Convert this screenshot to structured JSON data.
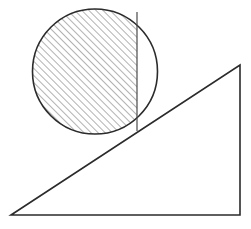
{
  "canvas": {
    "width": 251,
    "height": 229,
    "background_color": "#ffffff",
    "title": "Circle resting on an inclined plane with shaded circular segment"
  },
  "style": {
    "stroke_color": "#2b2b2b",
    "stroke_color_light": "#4a4a4a",
    "hatch_color": "#555555",
    "outline_width": 1.6,
    "chord_width": 1.2,
    "hatch_width": 0.9,
    "hatch_spacing": 5,
    "hatch_angle_degrees": 45,
    "fill_color": "none"
  },
  "figure": {
    "circle": {
      "label": "circle",
      "center_x": 95,
      "center_y": 71.5,
      "radius": 62.5
    },
    "chord": {
      "label": "vertical chord",
      "x": 137,
      "y_top": 12,
      "y_bottom": 131
    },
    "shaded_segment": {
      "label": "hatched major segment left of chord",
      "hatched": true
    },
    "unshaded_segment": {
      "label": "clear minor segment right of chord",
      "hatched": false
    },
    "triangle": {
      "label": "right triangle inclined plane",
      "points": "11,215 240,65 240,215",
      "vertex_left": {
        "x": 11,
        "y": 215
      },
      "vertex_apex": {
        "x": 240,
        "y": 65
      },
      "vertex_right": {
        "x": 240,
        "y": 215
      }
    },
    "tangent_point": {
      "label": "contact point of circle and incline",
      "x": 137,
      "y": 131
    }
  }
}
